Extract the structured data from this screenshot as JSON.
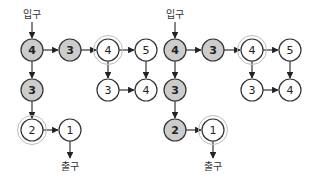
{
  "colors": {
    "visited_fill": "#cccccc",
    "unvisited_fill": "#ffffff",
    "stroke": "#333333",
    "halo": "#bbbbbb"
  },
  "labels": {
    "entrance": "입구",
    "exit": "출구"
  },
  "diagrams": [
    {
      "name": "left",
      "entrance": {
        "x": 32,
        "y": 14
      },
      "exit": {
        "x": 70,
        "y": 170
      },
      "nodes": [
        {
          "id": "a",
          "label": "4",
          "x": 32,
          "y": 50,
          "visited": true,
          "halo": false
        },
        {
          "id": "b",
          "label": "3",
          "x": 70,
          "y": 50,
          "visited": true,
          "halo": false
        },
        {
          "id": "c",
          "label": "4",
          "x": 108,
          "y": 50,
          "visited": false,
          "halo": true
        },
        {
          "id": "d",
          "label": "5",
          "x": 146,
          "y": 50,
          "visited": false,
          "halo": false
        },
        {
          "id": "e",
          "label": "3",
          "x": 32,
          "y": 90,
          "visited": true,
          "halo": false
        },
        {
          "id": "f",
          "label": "3",
          "x": 108,
          "y": 90,
          "visited": false,
          "halo": false
        },
        {
          "id": "g",
          "label": "4",
          "x": 146,
          "y": 90,
          "visited": false,
          "halo": false
        },
        {
          "id": "h",
          "label": "2",
          "x": 32,
          "y": 130,
          "visited": false,
          "halo": true
        },
        {
          "id": "i",
          "label": "1",
          "x": 70,
          "y": 130,
          "visited": false,
          "halo": false
        }
      ],
      "edges": [
        [
          "a",
          "b"
        ],
        [
          "b",
          "c"
        ],
        [
          "c",
          "d"
        ],
        [
          "a",
          "e"
        ],
        [
          "c",
          "f"
        ],
        [
          "d",
          "g"
        ],
        [
          "f",
          "g"
        ],
        [
          "e",
          "h"
        ],
        [
          "h",
          "i"
        ]
      ]
    },
    {
      "name": "right",
      "entrance": {
        "x": 175,
        "y": 14
      },
      "exit": {
        "x": 213,
        "y": 170
      },
      "nodes": [
        {
          "id": "a",
          "label": "4",
          "x": 175,
          "y": 50,
          "visited": true,
          "halo": false
        },
        {
          "id": "b",
          "label": "3",
          "x": 213,
          "y": 50,
          "visited": true,
          "halo": false
        },
        {
          "id": "c",
          "label": "4",
          "x": 252,
          "y": 50,
          "visited": false,
          "halo": true
        },
        {
          "id": "d",
          "label": "5",
          "x": 290,
          "y": 50,
          "visited": false,
          "halo": false
        },
        {
          "id": "e",
          "label": "3",
          "x": 175,
          "y": 90,
          "visited": true,
          "halo": false
        },
        {
          "id": "f",
          "label": "3",
          "x": 252,
          "y": 90,
          "visited": false,
          "halo": false
        },
        {
          "id": "g",
          "label": "4",
          "x": 290,
          "y": 90,
          "visited": false,
          "halo": false
        },
        {
          "id": "h",
          "label": "2",
          "x": 175,
          "y": 130,
          "visited": true,
          "halo": false
        },
        {
          "id": "i",
          "label": "1",
          "x": 213,
          "y": 130,
          "visited": false,
          "halo": true
        }
      ],
      "edges": [
        [
          "a",
          "b"
        ],
        [
          "b",
          "c"
        ],
        [
          "c",
          "d"
        ],
        [
          "a",
          "e"
        ],
        [
          "c",
          "f"
        ],
        [
          "d",
          "g"
        ],
        [
          "f",
          "g"
        ],
        [
          "e",
          "h"
        ],
        [
          "h",
          "i"
        ]
      ]
    }
  ]
}
